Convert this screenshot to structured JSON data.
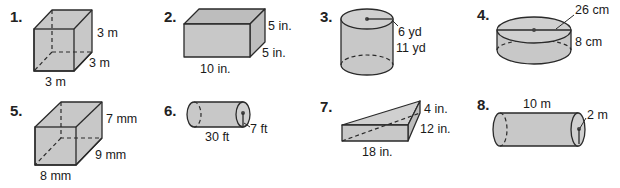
{
  "problems": [
    {
      "number": "1.",
      "shape": "cube",
      "labels": {
        "height": "3 m",
        "depth": "3 m",
        "width": "3 m"
      }
    },
    {
      "number": "2.",
      "shape": "rectangular-prism",
      "labels": {
        "height": "5 in.",
        "depth": "5 in.",
        "width": "10 in."
      }
    },
    {
      "number": "3.",
      "shape": "cylinder",
      "labels": {
        "radius": "6 yd",
        "height": "11 yd"
      }
    },
    {
      "number": "4.",
      "shape": "cylinder",
      "labels": {
        "diameter": "26 cm",
        "height": "8 cm"
      }
    },
    {
      "number": "5.",
      "shape": "rectangular-prism",
      "labels": {
        "height": "7 mm",
        "depth": "9 mm",
        "width": "8 mm"
      }
    },
    {
      "number": "6.",
      "shape": "horizontal-cylinder",
      "labels": {
        "length": "30 ft",
        "radius": "7 ft"
      }
    },
    {
      "number": "7.",
      "shape": "triangular-prism",
      "labels": {
        "a": "4 in.",
        "b": "12 in.",
        "length": "18 in."
      }
    },
    {
      "number": "8.",
      "shape": "horizontal-cylinder",
      "labels": {
        "length": "10 m",
        "radius": "2 m"
      }
    }
  ]
}
